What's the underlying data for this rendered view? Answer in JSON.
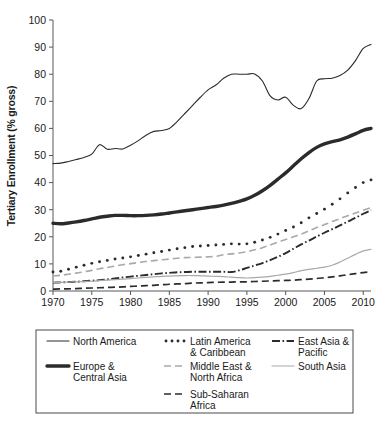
{
  "chart_data": {
    "type": "line",
    "title": "",
    "xlabel": "",
    "ylabel": "Tertiary Enrollment (% gross)",
    "xlim": [
      1970,
      2011
    ],
    "ylim": [
      0,
      100
    ],
    "ytick_step": 10,
    "xtick_step": 5,
    "grid": false,
    "legend_position": "bottom",
    "yticks": [
      "0",
      "10",
      "20",
      "30",
      "40",
      "50",
      "60",
      "70",
      "80",
      "90",
      "100"
    ],
    "xticks": [
      "1970",
      "1975",
      "1980",
      "1985",
      "1990",
      "1995",
      "2000",
      "2005",
      "2010"
    ],
    "x": [
      1970,
      1971,
      1972,
      1973,
      1974,
      1975,
      1976,
      1977,
      1978,
      1979,
      1980,
      1981,
      1982,
      1983,
      1984,
      1985,
      1986,
      1987,
      1988,
      1989,
      1990,
      1991,
      1992,
      1993,
      1994,
      1995,
      1996,
      1997,
      1998,
      1999,
      2000,
      2001,
      2002,
      2003,
      2004,
      2005,
      2006,
      2007,
      2008,
      2009,
      2010,
      2011
    ],
    "series": [
      {
        "name": "North America",
        "style": "solid-thin",
        "values": [
          47.0,
          47.2,
          47.8,
          48.5,
          49.3,
          50.5,
          54.0,
          52.3,
          52.6,
          52.4,
          53.8,
          55.5,
          57.5,
          58.9,
          59.2,
          60.0,
          62.5,
          65.5,
          68.5,
          71.5,
          74.2,
          76.0,
          78.5,
          80.0,
          80.0,
          80.0,
          80.1,
          77.5,
          72.0,
          70.5,
          71.5,
          68.5,
          67.3,
          71.0,
          77.5,
          78.3,
          78.5,
          79.5,
          81.5,
          85.0,
          89.5,
          91.0
        ]
      },
      {
        "name": "Europe & Central Asia",
        "style": "solid-thick",
        "values": [
          25.0,
          24.8,
          25.1,
          25.5,
          26.0,
          26.6,
          27.2,
          27.6,
          27.9,
          27.9,
          27.8,
          27.8,
          27.9,
          28.1,
          28.4,
          28.8,
          29.2,
          29.6,
          30.0,
          30.4,
          30.8,
          31.2,
          31.7,
          32.3,
          33.1,
          34.0,
          35.3,
          37.0,
          39.0,
          41.3,
          43.6,
          46.2,
          48.8,
          51.1,
          53.0,
          54.3,
          55.1,
          55.8,
          56.8,
          58.0,
          59.3,
          60.0
        ]
      },
      {
        "name": "Latin America & Caribbean",
        "style": "dotted",
        "values": [
          7.0,
          7.3,
          8.0,
          8.8,
          9.5,
          10.2,
          10.8,
          11.3,
          11.8,
          12.2,
          12.6,
          13.1,
          13.6,
          14.1,
          14.6,
          15.1,
          15.6,
          16.0,
          16.4,
          16.6,
          16.8,
          17.0,
          17.2,
          17.4,
          17.3,
          17.4,
          18.0,
          18.8,
          19.8,
          21.0,
          22.3,
          23.6,
          25.2,
          27.0,
          28.6,
          30.2,
          32.0,
          34.0,
          36.2,
          38.2,
          40.0,
          41.0
        ]
      },
      {
        "name": "Middle East & North Africa",
        "style": "dashed-gray",
        "values": [
          5.6,
          5.8,
          6.2,
          6.6,
          7.1,
          7.6,
          8.2,
          8.7,
          9.2,
          9.7,
          10.1,
          10.5,
          10.9,
          11.2,
          11.5,
          11.8,
          12.1,
          12.3,
          12.4,
          12.5,
          12.6,
          12.8,
          13.4,
          13.7,
          14.0,
          14.5,
          15.2,
          16.0,
          17.0,
          18.0,
          19.0,
          20.0,
          21.0,
          22.2,
          23.4,
          24.5,
          25.6,
          26.7,
          27.8,
          28.8,
          29.8,
          30.8
        ]
      },
      {
        "name": "East Asia & Pacific",
        "style": "dash-dot",
        "values": [
          3.1,
          3.2,
          3.3,
          3.4,
          3.6,
          3.8,
          4.0,
          4.3,
          4.6,
          5.0,
          5.3,
          5.6,
          5.9,
          6.2,
          6.5,
          6.7,
          6.9,
          7.0,
          7.1,
          7.1,
          7.1,
          7.1,
          7.1,
          7.0,
          7.6,
          8.5,
          9.4,
          10.3,
          11.4,
          12.6,
          14.0,
          15.6,
          17.2,
          18.6,
          20.1,
          21.5,
          22.8,
          24.2,
          25.6,
          27.0,
          28.5,
          29.8
        ]
      },
      {
        "name": "South Asia",
        "style": "solid-gray",
        "values": [
          3.2,
          3.2,
          3.3,
          3.4,
          3.5,
          3.6,
          3.8,
          4.0,
          4.2,
          4.4,
          4.6,
          4.8,
          5.0,
          5.2,
          5.4,
          5.5,
          5.6,
          5.7,
          5.7,
          5.6,
          5.5,
          5.4,
          5.3,
          5.1,
          4.9,
          4.8,
          4.9,
          5.1,
          5.4,
          5.8,
          6.2,
          6.8,
          7.5,
          8.0,
          8.4,
          8.8,
          9.5,
          10.7,
          12.1,
          13.5,
          14.8,
          15.4
        ]
      },
      {
        "name": "Sub-Saharan Africa",
        "style": "dashed-black",
        "values": [
          0.7,
          0.8,
          0.8,
          0.9,
          1.0,
          1.1,
          1.2,
          1.3,
          1.4,
          1.5,
          1.7,
          1.8,
          2.0,
          2.1,
          2.3,
          2.5,
          2.6,
          2.7,
          2.9,
          3.0,
          3.1,
          3.2,
          3.3,
          3.3,
          3.4,
          3.4,
          3.5,
          3.6,
          3.7,
          3.8,
          3.9,
          4.0,
          4.2,
          4.4,
          4.6,
          4.9,
          5.2,
          5.6,
          6.0,
          6.4,
          6.8,
          7.1
        ]
      }
    ],
    "legend": [
      {
        "label": "North America",
        "style": "solid-thin",
        "col": 0,
        "row": 0
      },
      {
        "label": "Latin America & Caribbean",
        "style": "dotted",
        "col": 1,
        "row": 0
      },
      {
        "label": "East Asia & Pacific",
        "style": "dash-dot",
        "col": 2,
        "row": 0
      },
      {
        "label": "Europe & Central Asia",
        "style": "solid-thick",
        "col": 0,
        "row": 1
      },
      {
        "label": "Middle East & North Africa",
        "style": "dashed-gray",
        "col": 1,
        "row": 1
      },
      {
        "label": "South Asia",
        "style": "solid-gray",
        "col": 2,
        "row": 1
      },
      {
        "label": "Sub-Saharan Africa",
        "style": "dashed-black",
        "col": 1,
        "row": 2
      }
    ],
    "colors": {
      "axis": "#55595c",
      "line_black": "#2b2b2b",
      "line_gray": "#a9a9a9",
      "text": "#1a1a1a",
      "legend_border": "#4a4a4a"
    }
  },
  "legend_labels": {
    "north_america": "North America",
    "latin_america_l1": "Latin America",
    "latin_america_l2": "& Caribbean",
    "east_asia_l1": "East Asia &",
    "east_asia_l2": "Pacific",
    "europe_l1": "Europe &",
    "europe_l2": "Central Asia",
    "mena_l1": "Middle East &",
    "mena_l2": "North Africa",
    "south_asia": "South Asia",
    "ssa_l1": "Sub-Saharan",
    "ssa_l2": "Africa"
  },
  "caption": {
    "partial_text": ""
  }
}
